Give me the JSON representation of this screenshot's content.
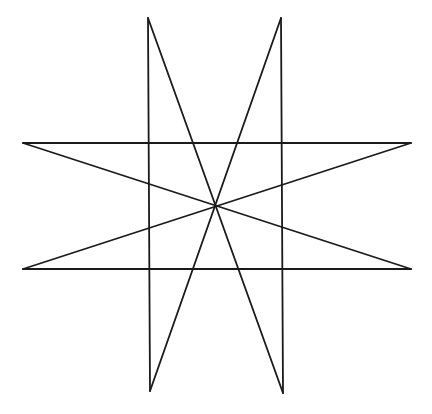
{
  "figure": {
    "stroke_color": "#1a1a1a",
    "background": "#ffffff",
    "stroke_width": 1.8,
    "center": [
      215,
      207
    ],
    "points": {
      "top_left": [
        148,
        18
      ],
      "top_right": [
        281,
        18
      ],
      "left_upper": [
        23,
        143
      ],
      "right_upper": [
        411,
        143
      ],
      "left_lower": [
        23,
        269
      ],
      "right_lower": [
        411,
        269
      ],
      "bottom_left": [
        150,
        391
      ],
      "bottom_right": [
        283,
        393
      ]
    },
    "lines": [
      {
        "name": "vertical-left",
        "from": [
          148,
          18
        ],
        "to": [
          150,
          391
        ]
      },
      {
        "name": "vertical-right",
        "from": [
          281,
          18
        ],
        "to": [
          283,
          393
        ]
      },
      {
        "name": "horizontal-top",
        "from": [
          23,
          143
        ],
        "to": [
          411,
          143
        ]
      },
      {
        "name": "horizontal-bottom",
        "from": [
          23,
          269
        ],
        "to": [
          411,
          269
        ]
      },
      {
        "name": "diagonal-topleft-bottomright",
        "from": [
          148,
          18
        ],
        "to": [
          283,
          393
        ]
      },
      {
        "name": "diagonal-topright-bottomleft",
        "from": [
          281,
          18
        ],
        "to": [
          150,
          391
        ]
      },
      {
        "name": "diagonal-leftupper-rightlower",
        "from": [
          23,
          143
        ],
        "to": [
          411,
          269
        ]
      },
      {
        "name": "diagonal-rightupper-leftlower",
        "from": [
          411,
          143
        ],
        "to": [
          23,
          269
        ]
      }
    ]
  }
}
